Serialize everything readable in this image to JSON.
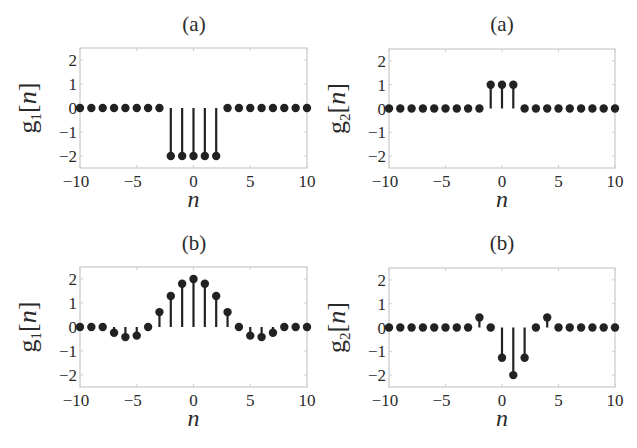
{
  "chart_data": [
    {
      "type": "stem",
      "title": "(a)",
      "xlabel": "n",
      "ylabel": "g1[n]",
      "ylabel_base": "g",
      "ylabel_sub": "1",
      "ylabel_arg": "[n]",
      "xlim": [
        -10,
        10
      ],
      "ylim": [
        -2.5,
        2.5
      ],
      "xticks": [
        -10,
        -5,
        0,
        5,
        10
      ],
      "yticks": [
        2,
        1,
        0,
        -1,
        -2
      ],
      "x": [
        -10,
        -9,
        -8,
        -7,
        -6,
        -5,
        -4,
        -3,
        -2,
        -1,
        0,
        1,
        2,
        3,
        4,
        5,
        6,
        7,
        8,
        9,
        10
      ],
      "values": [
        0,
        0,
        0,
        0,
        0,
        0,
        0,
        0,
        -2,
        -2,
        -2,
        -2,
        -2,
        0,
        0,
        0,
        0,
        0,
        0,
        0,
        0
      ]
    },
    {
      "type": "stem",
      "title": "(a)",
      "xlabel": "n",
      "ylabel": "g2[n]",
      "ylabel_base": "g",
      "ylabel_sub": "2",
      "ylabel_arg": "[n]",
      "xlim": [
        -10,
        10
      ],
      "ylim": [
        -2.5,
        2.5
      ],
      "xticks": [
        -10,
        -5,
        0,
        5,
        10
      ],
      "yticks": [
        2,
        1,
        0,
        -1,
        -2
      ],
      "x": [
        -10,
        -9,
        -8,
        -7,
        -6,
        -5,
        -4,
        -3,
        -2,
        -1,
        0,
        1,
        2,
        3,
        4,
        5,
        6,
        7,
        8,
        9,
        10
      ],
      "values": [
        0,
        0,
        0,
        0,
        0,
        0,
        0,
        0,
        0,
        1,
        1,
        1,
        0,
        0,
        0,
        0,
        0,
        0,
        0,
        0,
        0
      ]
    },
    {
      "type": "stem",
      "title": "(b)",
      "xlabel": "n",
      "ylabel": "g1[n]",
      "ylabel_base": "g",
      "ylabel_sub": "1",
      "ylabel_arg": "[n]",
      "xlim": [
        -10,
        10
      ],
      "ylim": [
        -2.5,
        2.5
      ],
      "xticks": [
        -10,
        -5,
        0,
        5,
        10
      ],
      "yticks": [
        2,
        1,
        0,
        -1,
        -2
      ],
      "x": [
        -10,
        -9,
        -8,
        -7,
        -6,
        -5,
        -4,
        -3,
        -2,
        -1,
        0,
        1,
        2,
        3,
        4,
        5,
        6,
        7,
        8,
        9,
        10
      ],
      "values": [
        0,
        0,
        0,
        -0.24,
        -0.42,
        -0.36,
        0,
        0.62,
        1.29,
        1.8,
        2.0,
        1.8,
        1.29,
        0.62,
        0,
        -0.36,
        -0.42,
        -0.24,
        0,
        0,
        0
      ]
    },
    {
      "type": "stem",
      "title": "(b)",
      "xlabel": "n",
      "ylabel": "g2[n]",
      "ylabel_base": "g",
      "ylabel_sub": "2",
      "ylabel_arg": "[n]",
      "xlim": [
        -10,
        10
      ],
      "ylim": [
        -2.5,
        2.5
      ],
      "xticks": [
        -10,
        -5,
        0,
        5,
        10
      ],
      "yticks": [
        2,
        1,
        0,
        -1,
        -2
      ],
      "x": [
        -10,
        -9,
        -8,
        -7,
        -6,
        -5,
        -4,
        -3,
        -2,
        -1,
        0,
        1,
        2,
        3,
        4,
        5,
        6,
        7,
        8,
        9,
        10
      ],
      "values": [
        0,
        0,
        0,
        0,
        0,
        0,
        0,
        0,
        0.42,
        0,
        -1.27,
        -2.0,
        -1.27,
        0,
        0.42,
        0,
        0,
        0,
        0,
        0,
        0
      ]
    }
  ],
  "layout": {
    "panels": [
      {
        "left": 80,
        "right": 307,
        "top": 48,
        "bottom": 168,
        "title_x": 194,
        "title_y": 31,
        "ylabel_x": 36
      },
      {
        "left": 389,
        "right": 615,
        "top": 49,
        "bottom": 168,
        "title_x": 502,
        "title_y": 31,
        "ylabel_x": 345
      },
      {
        "left": 80,
        "right": 307,
        "top": 267,
        "bottom": 387,
        "title_x": 194,
        "title_y": 250,
        "ylabel_x": 36
      },
      {
        "left": 389,
        "right": 615,
        "top": 268,
        "bottom": 387,
        "title_x": 502,
        "title_y": 250,
        "ylabel_x": 345
      }
    ]
  }
}
